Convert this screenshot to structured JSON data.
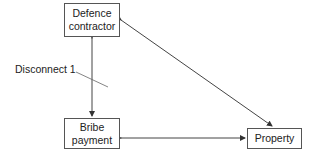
{
  "nodes": {
    "defence_contractor": {
      "line1": "Defence",
      "line2": "contractor"
    },
    "bribe_payment": {
      "line1": "Bribe",
      "line2": "payment"
    },
    "property": {
      "label": "Property"
    }
  },
  "annotations": {
    "disconnect": "Disconnect 1"
  },
  "edges": [
    {
      "from": "defence_contractor",
      "to": "bribe_payment",
      "type": "bidirectional"
    },
    {
      "from": "bribe_payment",
      "to": "property",
      "type": "bidirectional"
    },
    {
      "from": "defence_contractor",
      "to": "property",
      "type": "bidirectional"
    }
  ],
  "colors": {
    "line": "#444444",
    "border": "#555555"
  }
}
